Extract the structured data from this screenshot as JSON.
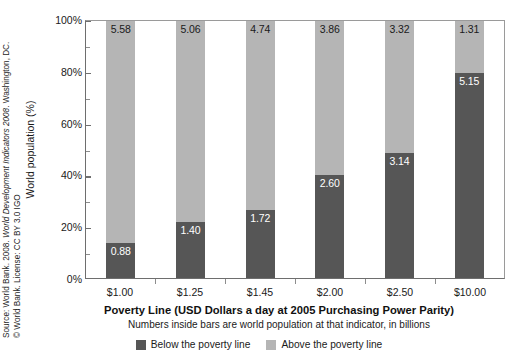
{
  "source": {
    "line1_prefix": "Source: World Bank. 2008. ",
    "line1_italic": "World Development Indicators 2008",
    "line1_suffix": ". Washington, DC.",
    "line2": "© World Bank. License: CC BY 3.0 IGO"
  },
  "colors": {
    "below": "#565656",
    "above": "#b5b5b5",
    "axis": "#6e6e6e",
    "text": "#1a1a1a",
    "background": "#ffffff"
  },
  "legend": {
    "items": [
      {
        "label": "Below the poverty line",
        "color": "#565656"
      },
      {
        "label": "Above the poverty line",
        "color": "#b5b5b5"
      }
    ]
  },
  "chart_data": {
    "type": "bar",
    "title": "",
    "xlabel": "Poverty Line (USD Dollars a day at 2005 Purchasing Power Parity)",
    "xlabel_note": "Numbers inside bars are world population at that indicator, in billions",
    "ylabel": "World population (%)",
    "ylim": [
      0,
      100
    ],
    "ytick_labels": [
      "0%",
      "20%",
      "40%",
      "60%",
      "80%",
      "100%"
    ],
    "ytick_values": [
      0,
      20,
      40,
      60,
      80,
      100
    ],
    "yminor_values": [
      10,
      30,
      50,
      70,
      90
    ],
    "grid": false,
    "stacked": true,
    "legend_position": "bottom",
    "total_billions": 6.46,
    "categories": [
      "$1.00",
      "$1.25",
      "$1.45",
      "$2.00",
      "$2.50",
      "$10.00"
    ],
    "series": [
      {
        "name": "Below the poverty line",
        "color": "#565656",
        "values": [
          0.88,
          1.4,
          1.72,
          2.6,
          3.14,
          5.15
        ],
        "labels": [
          "0.88",
          "1.40",
          "1.72",
          "2.60",
          "3.14",
          "5.15"
        ],
        "percents": [
          13.6,
          21.7,
          26.6,
          40.2,
          48.6,
          79.7
        ]
      },
      {
        "name": "Above the poverty line",
        "color": "#b5b5b5",
        "values": [
          5.58,
          5.06,
          4.74,
          3.86,
          3.32,
          1.31
        ],
        "labels": [
          "5.58",
          "5.06",
          "4.74",
          "3.86",
          "3.32",
          "1.31"
        ],
        "percents": [
          86.4,
          78.3,
          73.4,
          59.8,
          51.4,
          20.3
        ]
      }
    ]
  }
}
